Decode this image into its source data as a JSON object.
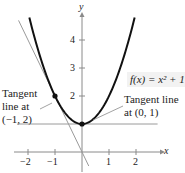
{
  "chart_data": {
    "type": "line",
    "title": "",
    "xlabel": "x",
    "ylabel": "y",
    "xlim": [
      -2.4,
      2.9
    ],
    "ylim": [
      -0.7,
      5.4
    ],
    "grid": false,
    "x_ticks": [
      -2,
      -1,
      1,
      2
    ],
    "x_tick_labels": [
      "−2",
      "−1",
      "1",
      "2"
    ],
    "y_ticks": [
      1,
      2,
      3,
      4
    ],
    "y_tick_labels": [
      "",
      "2",
      "3",
      "4"
    ],
    "series": [
      {
        "name": "f(x) = x^2 + 1",
        "kind": "curve",
        "color": "#111111",
        "x": [
          -1.95,
          -1.5,
          -1,
          -0.5,
          0,
          0.5,
          1,
          1.5,
          1.95
        ],
        "y": [
          4.8,
          3.25,
          2,
          1.25,
          1,
          1.25,
          2,
          3.25,
          4.8
        ]
      },
      {
        "name": "Tangent line at (-1, 2)",
        "kind": "line",
        "color": "#999999",
        "x": [
          -2.35,
          0.25
        ],
        "y": [
          4.7,
          -0.5
        ]
      },
      {
        "name": "Tangent line at (0, 1)",
        "kind": "line",
        "color": "#999999",
        "x": [
          -2.4,
          2.8
        ],
        "y": [
          1,
          1
        ]
      }
    ],
    "points": [
      {
        "x": -1,
        "y": 2,
        "label": "(−1, 2)"
      },
      {
        "x": 0,
        "y": 1,
        "label": "(0, 1)"
      }
    ],
    "annotations": [
      {
        "text": "f(x) = x² + 1",
        "target": "curve"
      },
      {
        "text": "Tangent line at (−1, 2)",
        "target": "point(-1,2)"
      },
      {
        "text": "Tangent line at (0, 1)",
        "target": "point(0,1)"
      }
    ]
  },
  "labels": {
    "x_axis": "x",
    "y_axis": "y",
    "function": "f(x) = x² + 1",
    "tangent_left_line1": "Tangent",
    "tangent_left_line2": "line at",
    "tangent_left_line3": "(−1, 2)",
    "tangent_right_line1": "Tangent line",
    "tangent_right_line2": "at (0, 1)",
    "ticks_x": [
      "−2",
      "−1",
      "1",
      "2"
    ],
    "ticks_y": [
      "2",
      "3",
      "4"
    ]
  },
  "colors": {
    "curve": "#111111",
    "tangent": "#9a9a9a",
    "axis": "#8a8a8a",
    "point": "#111111",
    "label_bg": "#f2f2f2"
  }
}
